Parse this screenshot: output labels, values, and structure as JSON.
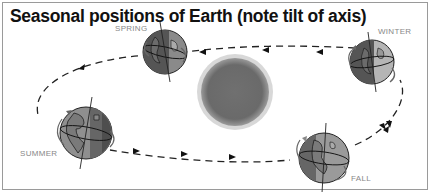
{
  "title": "Seasonal positions of Earth (note tilt of axis)",
  "labels": {
    "spring": "SPRING",
    "winter": "WINTER",
    "summer": "SUMMER",
    "fall": "FALL"
  },
  "elements": {
    "center": "sun",
    "orbit": "dashed elliptical orbit with arrows",
    "earths": [
      "spring",
      "winter",
      "summer",
      "fall"
    ]
  },
  "colors": {
    "earth_dark": "#555555",
    "earth_mid": "#8a8a8a",
    "earth_light": "#b5b5b5",
    "sun": "#6e6e6e",
    "border": "#9a9a9a"
  }
}
